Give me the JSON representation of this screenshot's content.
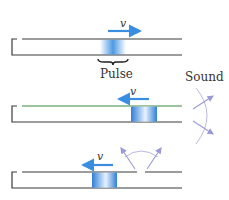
{
  "diagram": {
    "type": "tube-pulse-reflection",
    "colors": {
      "tube": "#3a3a3a",
      "tube_green": "#3a8a3a",
      "pulse": "#3a8ee0",
      "arrow": "#3a8ee0",
      "sound": "#9a9ad8"
    },
    "panels": [
      {
        "id": "panel-1",
        "velocity_label": "v",
        "velocity_direction": "right",
        "pulse_label": "Pulse"
      },
      {
        "id": "panel-2",
        "velocity_label": "v",
        "velocity_direction": "left",
        "sound_label": "Sound"
      },
      {
        "id": "panel-3",
        "velocity_label": "v",
        "velocity_direction": "left"
      }
    ]
  }
}
